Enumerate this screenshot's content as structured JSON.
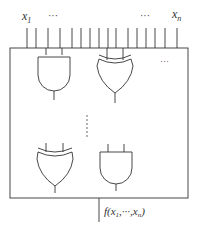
{
  "diagram": {
    "type": "boolean-circuit",
    "inputs": {
      "first_label": "x",
      "first_sub": "1",
      "last_label": "x",
      "last_sub": "n",
      "ellipsis_left": "···",
      "ellipsis_right": "···",
      "count_drawn": 16
    },
    "gates": [
      {
        "type": "AND",
        "position": "top-left"
      },
      {
        "type": "XOR",
        "position": "top-middle"
      },
      {
        "type": "XOR",
        "position": "bottom-left"
      },
      {
        "type": "AND",
        "position": "bottom-middle"
      }
    ],
    "ellipsis_horizontal": "···",
    "ellipsis_vertical": "⋮",
    "output": {
      "label": "f(x",
      "sub1": "1",
      "mid": ",···,x",
      "sub2": "n",
      "end": ")"
    },
    "colors": {
      "stroke": "#333333",
      "background": "#ffffff"
    }
  }
}
